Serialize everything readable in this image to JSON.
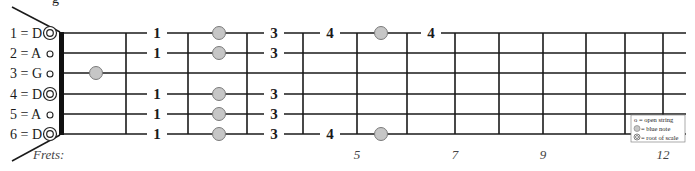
{
  "title_fragment": "g",
  "diagram": {
    "strings": [
      {
        "number": 1,
        "note": "D",
        "label": "1 = D",
        "open_marker": "root",
        "y": 33
      },
      {
        "number": 2,
        "note": "A",
        "label": "2 = A",
        "open_marker": "open",
        "y": 53
      },
      {
        "number": 3,
        "note": "G",
        "label": "3 = G",
        "open_marker": "open",
        "y": 73
      },
      {
        "number": 4,
        "note": "D",
        "label": "4 = D",
        "open_marker": "root",
        "y": 94
      },
      {
        "number": 5,
        "note": "A",
        "label": "5 = A",
        "open_marker": "open",
        "y": 114
      },
      {
        "number": 6,
        "note": "D",
        "label": "6 = D",
        "open_marker": "root",
        "y": 134
      }
    ],
    "nut_x": 61,
    "string_end_x": 686,
    "fret_xs": [
      126,
      188,
      247,
      303,
      357,
      407,
      455,
      499,
      543,
      586,
      625,
      663
    ],
    "frets_label": "Frets:",
    "fret_numbers": [
      {
        "label": "5",
        "x": 357
      },
      {
        "label": "7",
        "x": 455
      },
      {
        "label": "9",
        "x": 543
      },
      {
        "label": "12",
        "x": 663
      }
    ],
    "fingerings": [
      {
        "string": 1,
        "x": 157,
        "label": "1"
      },
      {
        "string": 1,
        "x": 274,
        "label": "3"
      },
      {
        "string": 1,
        "x": 330,
        "label": "4"
      },
      {
        "string": 1,
        "x": 431,
        "label": "4"
      },
      {
        "string": 2,
        "x": 157,
        "label": "1"
      },
      {
        "string": 2,
        "x": 274,
        "label": "3"
      },
      {
        "string": 4,
        "x": 157,
        "label": "1"
      },
      {
        "string": 4,
        "x": 274,
        "label": "3"
      },
      {
        "string": 5,
        "x": 157,
        "label": "1"
      },
      {
        "string": 5,
        "x": 274,
        "label": "3"
      },
      {
        "string": 6,
        "x": 157,
        "label": "1"
      },
      {
        "string": 6,
        "x": 274,
        "label": "3"
      },
      {
        "string": 6,
        "x": 330,
        "label": "4"
      }
    ],
    "blue_notes": [
      {
        "string": 1,
        "x": 219
      },
      {
        "string": 1,
        "x": 381
      },
      {
        "string": 2,
        "x": 219
      },
      {
        "string": 3,
        "x": 96
      },
      {
        "string": 4,
        "x": 219
      },
      {
        "string": 5,
        "x": 219
      },
      {
        "string": 6,
        "x": 219
      },
      {
        "string": 6,
        "x": 381
      }
    ],
    "colors": {
      "line": "#1a1a1a",
      "blue_note_fill": "#c6c6c6",
      "blue_note_stroke": "#7a7a7a",
      "legend_border": "#888888"
    }
  },
  "legend": {
    "items": [
      {
        "symbol": "open-string",
        "text": "o = open string"
      },
      {
        "symbol": "blue-note",
        "text": "= blue note"
      },
      {
        "symbol": "root",
        "text": "= root of scale"
      }
    ]
  }
}
